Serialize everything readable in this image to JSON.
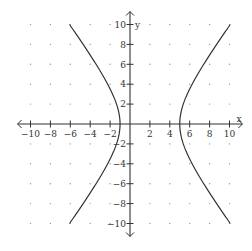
{
  "chart_data": {
    "type": "line",
    "title": "",
    "xlabel": "x",
    "ylabel": "y",
    "xlim": [
      -11,
      11
    ],
    "ylim": [
      -11,
      11
    ],
    "x_ticks": [
      -10,
      -8,
      -6,
      -4,
      -2,
      2,
      4,
      6,
      8,
      10
    ],
    "y_ticks": [
      10,
      8,
      6,
      4,
      2,
      -2,
      -4,
      -6,
      -8,
      -10
    ],
    "x_tick_labels": [
      "-10",
      "-8",
      "-6",
      "-4",
      "-2",
      "2",
      "4",
      "6",
      "8",
      "10"
    ],
    "y_tick_labels": [
      "10",
      "8",
      "6",
      "4",
      "2",
      "-2",
      "-4",
      "-6",
      "-8",
      "-10"
    ],
    "grid": "dots",
    "grid_step": 2,
    "curve": {
      "kind": "hyperbola",
      "equation": "(x-2)^2/9 - y^2/16 = 1",
      "center": [
        2,
        0
      ],
      "a": 3,
      "b": 4,
      "orientation": "horizontal",
      "y_range": [
        -10,
        10
      ],
      "vertices": [
        [
          -1,
          0
        ],
        [
          5,
          0
        ]
      ]
    },
    "colors": {
      "curve": "#333333",
      "axis": "#333333",
      "grid_dot": "#999999"
    }
  }
}
